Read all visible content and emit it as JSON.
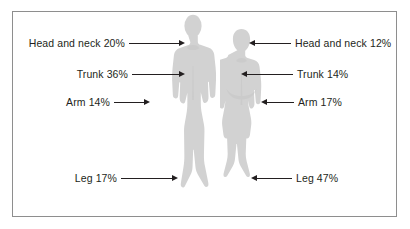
{
  "diagram": {
    "colors": {
      "silhouette": "#d2d2d2",
      "silhouette_shade": "#c6c6c6",
      "border": "#8e8e8e",
      "text": "#231f20",
      "background": "#ffffff"
    },
    "figures": [
      {
        "name": "adult-male-silhouette",
        "side": "left"
      },
      {
        "name": "adult-female-silhouette",
        "side": "right"
      }
    ],
    "callouts_left": [
      {
        "name": "head-and-neck",
        "label": "Head and neck 20%",
        "region": "Head and neck",
        "value": 20,
        "unit": "%"
      },
      {
        "name": "trunk",
        "label": "Trunk 36%",
        "region": "Trunk",
        "value": 36,
        "unit": "%"
      },
      {
        "name": "arm",
        "label": "Arm 14%",
        "region": "Arm",
        "value": 14,
        "unit": "%"
      },
      {
        "name": "leg",
        "label": "Leg 17%",
        "region": "Leg",
        "value": 17,
        "unit": "%"
      }
    ],
    "callouts_right": [
      {
        "name": "head-and-neck",
        "label": "Head and neck 12%",
        "region": "Head and neck",
        "value": 12,
        "unit": "%"
      },
      {
        "name": "trunk",
        "label": "Trunk 14%",
        "region": "Trunk",
        "value": 14,
        "unit": "%"
      },
      {
        "name": "arm",
        "label": "Arm 17%",
        "region": "Arm",
        "value": 17,
        "unit": "%"
      },
      {
        "name": "leg",
        "label": "Leg 47%",
        "region": "Leg",
        "value": 47,
        "unit": "%"
      }
    ]
  }
}
